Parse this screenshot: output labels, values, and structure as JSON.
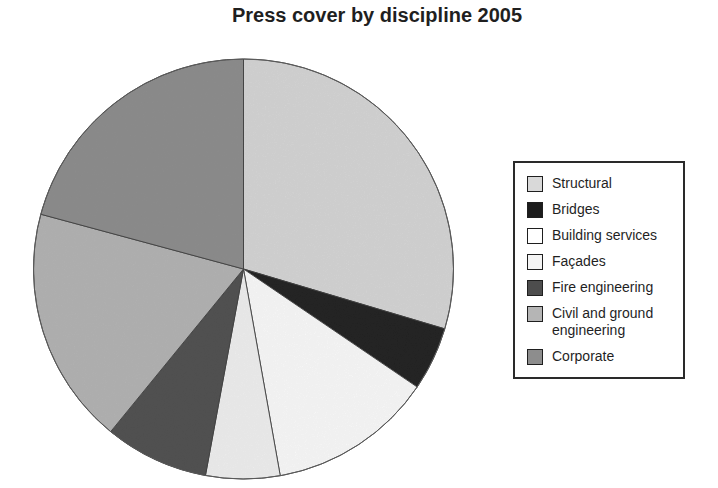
{
  "title": "Press cover by discipline 2005",
  "colors": {
    "background": "#ffffff",
    "text": "#1f1f1f",
    "slice_stroke": "#3c3c3c",
    "legend_border": "#2a2a2a"
  },
  "chart_data": {
    "type": "pie",
    "title": "Press cover by discipline 2005",
    "legend_position": "right",
    "direction": "clockwise",
    "start_angle_deg": 0,
    "values_are_percent_estimates": true,
    "slices": [
      {
        "label": "Structural",
        "value": 29.6,
        "color": "#d9d9d9"
      },
      {
        "label": "Bridges",
        "value": 4.9,
        "color": "#1c1c1c"
      },
      {
        "label": "Building services",
        "value": 12.7,
        "color": "#ffffff"
      },
      {
        "label": "Façades",
        "value": 5.7,
        "color": "#f4f4f4"
      },
      {
        "label": "Fire engineering",
        "value": 8.0,
        "color": "#4d4d4d"
      },
      {
        "label": "Civil and ground engineering",
        "value": 18.3,
        "color": "#b5b5b5"
      },
      {
        "label": "Corporate",
        "value": 20.8,
        "color": "#8d8d8d"
      }
    ]
  }
}
